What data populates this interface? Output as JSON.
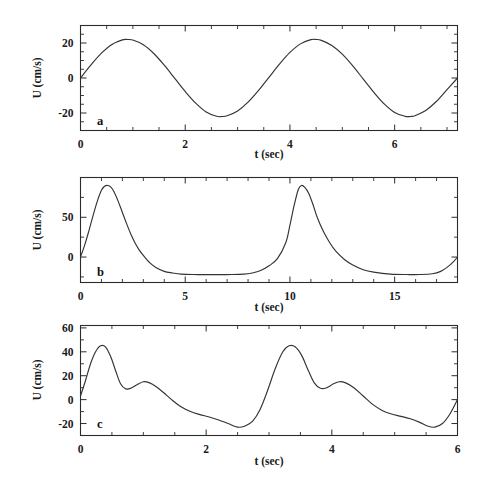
{
  "figure": {
    "title": "",
    "panels": [
      "a",
      "b",
      "c"
    ]
  },
  "chart_data": [
    {
      "type": "line",
      "panel_label": "a",
      "title": "",
      "xlabel": "t (sec)",
      "ylabel": "U (cm/s)",
      "xlim": [
        0,
        7.2
      ],
      "ylim": [
        -30,
        30
      ],
      "xticks": [
        0,
        2,
        4,
        6
      ],
      "xtick_labels": [
        "0",
        "2",
        "4",
        "6"
      ],
      "xticks_minor": [
        0.5,
        1,
        1.5,
        2.5,
        3,
        3.5,
        4.5,
        5,
        5.5,
        6.5,
        7
      ],
      "yticks": [
        -20,
        0,
        20
      ],
      "ytick_labels": [
        "-20",
        "0",
        "20"
      ],
      "yticks_minor": [
        -25,
        -15,
        -10,
        -5,
        5,
        10,
        15,
        25
      ],
      "grid": false,
      "legend": "none",
      "waveform": "sinusoid",
      "amplitude": 22,
      "period": 3.6,
      "x": [
        0.0,
        0.2,
        0.4,
        0.6,
        0.8,
        0.9,
        1.0,
        1.2,
        1.4,
        1.6,
        1.8,
        2.0,
        2.2,
        2.4,
        2.6,
        2.7,
        2.8,
        3.0,
        3.2,
        3.4,
        3.6,
        3.8,
        4.0,
        4.2,
        4.4,
        4.5,
        4.6,
        4.8,
        5.0,
        5.2,
        5.4,
        5.6,
        5.8,
        6.0,
        6.2,
        6.3,
        6.4,
        6.6,
        6.8,
        7.0,
        7.2
      ],
      "y": [
        0,
        7.5,
        14.2,
        19.2,
        21.8,
        22.0,
        21.7,
        19.0,
        14.0,
        7.3,
        -0.2,
        -7.7,
        -14.4,
        -19.4,
        -21.9,
        -22.0,
        -21.6,
        -18.8,
        -13.8,
        -7.1,
        0.4,
        7.9,
        14.6,
        19.5,
        21.9,
        22.0,
        21.5,
        18.6,
        13.6,
        6.9,
        -0.6,
        -8.1,
        -14.8,
        -19.7,
        -21.9,
        -22.0,
        -21.4,
        -18.4,
        -13.3,
        -6.6,
        0.0
      ]
    },
    {
      "type": "line",
      "panel_label": "b",
      "title": "",
      "xlabel": "t (sec)",
      "ylabel": "U (cm/s)",
      "xlim": [
        0,
        18
      ],
      "ylim": [
        -32,
        100
      ],
      "xticks": [
        0,
        5,
        10,
        15
      ],
      "xtick_labels": [
        "0",
        "5",
        "10",
        "15"
      ],
      "xticks_minor": [
        1,
        2,
        3,
        4,
        6,
        7,
        8,
        9,
        11,
        12,
        13,
        14,
        16,
        17,
        18
      ],
      "yticks": [
        0,
        50
      ],
      "ytick_labels": [
        "0",
        "50"
      ],
      "yticks_minor": [
        -25,
        25,
        75,
        100
      ],
      "grid": false,
      "legend": "none",
      "waveform": "cnoidal",
      "peak_value": 90,
      "trough_value": -22,
      "period": 9.1,
      "x": [
        0.0,
        0.2,
        0.4,
        0.6,
        0.8,
        1.0,
        1.15,
        1.3,
        1.45,
        1.6,
        1.8,
        2.0,
        2.2,
        2.4,
        2.6,
        2.8,
        3.0,
        3.3,
        3.6,
        4.0,
        4.4,
        4.8,
        5.4,
        6.0,
        6.6,
        7.2,
        7.8,
        8.2,
        8.6,
        9.0,
        9.4,
        9.8,
        10.0,
        10.2,
        10.4,
        10.55,
        10.7,
        10.9,
        11.1,
        11.3,
        11.6,
        11.9,
        12.2,
        12.6,
        13.0,
        13.5,
        14.0,
        14.8,
        15.6,
        16.2,
        16.8,
        17.2,
        17.5,
        17.8,
        18.0
      ],
      "y": [
        0,
        15,
        33,
        52,
        70,
        84,
        89,
        90,
        88,
        82,
        70,
        56,
        42,
        29,
        18,
        9,
        2,
        -7,
        -13,
        -18,
        -20,
        -21.5,
        -22,
        -22,
        -22,
        -22,
        -21.5,
        -20,
        -17,
        -11,
        -2,
        18,
        40,
        65,
        85,
        90,
        88,
        80,
        66,
        50,
        32,
        18,
        7,
        -3,
        -10,
        -16,
        -19,
        -21.5,
        -22,
        -22,
        -21,
        -18,
        -13,
        -6,
        0
      ]
    },
    {
      "type": "line",
      "panel_label": "c",
      "title": "",
      "xlabel": "t (sec)",
      "ylabel": "U (cm/s)",
      "xlim": [
        0,
        6
      ],
      "ylim": [
        -30,
        62
      ],
      "xticks": [
        0,
        2,
        4,
        6
      ],
      "xtick_labels": [
        "0",
        "2",
        "4",
        "6"
      ],
      "xticks_minor": [
        0.5,
        1,
        1.5,
        2.5,
        3,
        3.5,
        4.5,
        5,
        5.5
      ],
      "yticks": [
        -20,
        0,
        20,
        40,
        60
      ],
      "ytick_labels": [
        "-20",
        "0",
        "20",
        "40",
        "60"
      ],
      "yticks_minor": [
        -10,
        10,
        30,
        50
      ],
      "grid": false,
      "legend": "none",
      "waveform": "double-peaked",
      "primary_peak_value": 45,
      "secondary_peak_value": 15,
      "trough_value": -23,
      "period": 3.0,
      "x": [
        0.0,
        0.08,
        0.16,
        0.24,
        0.32,
        0.4,
        0.48,
        0.56,
        0.64,
        0.72,
        0.8,
        0.9,
        1.0,
        1.1,
        1.2,
        1.32,
        1.45,
        1.6,
        1.75,
        1.9,
        2.05,
        2.2,
        2.35,
        2.5,
        2.62,
        2.74,
        2.86,
        2.98,
        3.1,
        3.22,
        3.32,
        3.42,
        3.52,
        3.62,
        3.72,
        3.82,
        3.92,
        4.02,
        4.12,
        4.22,
        4.35,
        4.5,
        4.65,
        4.8,
        4.95,
        5.1,
        5.25,
        5.4,
        5.52,
        5.64,
        5.76,
        5.88,
        6.0
      ],
      "y": [
        3,
        16,
        30,
        40,
        45,
        44,
        36,
        24,
        13,
        9,
        9.5,
        12.5,
        15,
        14,
        11,
        6,
        0,
        -6,
        -10,
        -12.5,
        -14.5,
        -17,
        -20,
        -23,
        -22,
        -18,
        -8,
        8,
        26,
        40,
        45,
        44,
        37,
        25,
        14,
        9.5,
        10,
        13,
        15,
        14,
        10,
        3,
        -4,
        -9,
        -12,
        -14,
        -16,
        -19,
        -22,
        -23,
        -20,
        -12,
        0
      ]
    }
  ],
  "axis_labels": {
    "x_title": "t (sec)",
    "y_title": "U (cm/s)"
  }
}
